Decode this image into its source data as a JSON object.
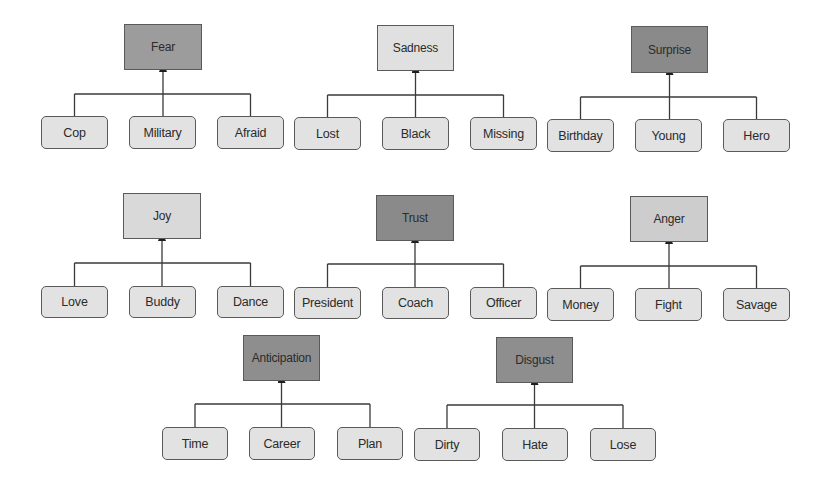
{
  "diagram": {
    "title": "",
    "colors": {
      "dark": "#8e8e8e",
      "medium": "#c6c6c6",
      "light": "#dedede",
      "child": "#e2e2e2",
      "line": "#3a3a3a"
    },
    "groups": [
      {
        "parent": {
          "label": "Fear",
          "shade": "medium-dark",
          "fill": "#9c9c9c",
          "x": 124,
          "y": 24,
          "w": 78,
          "h": 46
        },
        "bar_y": 94,
        "children": [
          {
            "label": "Cop",
            "x": 41,
            "y": 116,
            "w": 67,
            "h": 33
          },
          {
            "label": "Military",
            "x": 129,
            "y": 116,
            "w": 67,
            "h": 33
          },
          {
            "label": "Afraid",
            "x": 217,
            "y": 116,
            "w": 67,
            "h": 33
          }
        ]
      },
      {
        "parent": {
          "label": "Sadness",
          "shade": "light",
          "fill": "#e0e0e0",
          "x": 377,
          "y": 25,
          "w": 77,
          "h": 46
        },
        "bar_y": 95,
        "children": [
          {
            "label": "Lost",
            "x": 294,
            "y": 117,
            "w": 67,
            "h": 33
          },
          {
            "label": "Black",
            "x": 382,
            "y": 117,
            "w": 67,
            "h": 33
          },
          {
            "label": "Missing",
            "x": 470,
            "y": 117,
            "w": 67,
            "h": 33
          }
        ]
      },
      {
        "parent": {
          "label": "Surprise",
          "shade": "dark",
          "fill": "#8a8a8a",
          "x": 631,
          "y": 26,
          "w": 77,
          "h": 47
        },
        "bar_y": 97,
        "children": [
          {
            "label": "Birthday",
            "x": 547,
            "y": 119,
            "w": 67,
            "h": 33
          },
          {
            "label": "Young",
            "x": 635,
            "y": 119,
            "w": 67,
            "h": 33
          },
          {
            "label": "Hero",
            "x": 723,
            "y": 119,
            "w": 67,
            "h": 33
          }
        ]
      },
      {
        "parent": {
          "label": "Joy",
          "shade": "light",
          "fill": "#d9d9d9",
          "x": 123,
          "y": 193,
          "w": 78,
          "h": 46
        },
        "bar_y": 263,
        "children": [
          {
            "label": "Love",
            "x": 41,
            "y": 286,
            "w": 67,
            "h": 32
          },
          {
            "label": "Buddy",
            "x": 129,
            "y": 286,
            "w": 67,
            "h": 32
          },
          {
            "label": "Dance",
            "x": 217,
            "y": 286,
            "w": 67,
            "h": 32
          }
        ]
      },
      {
        "parent": {
          "label": "Trust",
          "shade": "dark",
          "fill": "#8a8a8a",
          "x": 376,
          "y": 195,
          "w": 78,
          "h": 46
        },
        "bar_y": 264,
        "children": [
          {
            "label": "President",
            "x": 294,
            "y": 287,
            "w": 67,
            "h": 32
          },
          {
            "label": "Coach",
            "x": 382,
            "y": 287,
            "w": 67,
            "h": 32
          },
          {
            "label": "Officer",
            "x": 470,
            "y": 287,
            "w": 67,
            "h": 32
          }
        ]
      },
      {
        "parent": {
          "label": "Anger",
          "shade": "medium",
          "fill": "#cdcdcd",
          "x": 630,
          "y": 196,
          "w": 78,
          "h": 46
        },
        "bar_y": 266,
        "children": [
          {
            "label": "Money",
            "x": 547,
            "y": 288,
            "w": 67,
            "h": 33
          },
          {
            "label": "Fight",
            "x": 635,
            "y": 288,
            "w": 67,
            "h": 33
          },
          {
            "label": "Savage",
            "x": 723,
            "y": 288,
            "w": 67,
            "h": 33
          }
        ]
      },
      {
        "parent": {
          "label": "Anticipation",
          "shade": "dark",
          "fill": "#8e8e8e",
          "x": 243,
          "y": 335,
          "w": 77,
          "h": 46
        },
        "bar_y": 404,
        "children": [
          {
            "label": "Time",
            "x": 162,
            "y": 427,
            "w": 66,
            "h": 33
          },
          {
            "label": "Career",
            "x": 249,
            "y": 427,
            "w": 66,
            "h": 33
          },
          {
            "label": "Plan",
            "x": 337,
            "y": 427,
            "w": 66,
            "h": 33
          }
        ]
      },
      {
        "parent": {
          "label": "Disgust",
          "shade": "dark",
          "fill": "#8e8e8e",
          "x": 496,
          "y": 337,
          "w": 77,
          "h": 46
        },
        "bar_y": 405,
        "children": [
          {
            "label": "Dirty",
            "x": 414,
            "y": 428,
            "w": 66,
            "h": 33
          },
          {
            "label": "Hate",
            "x": 502,
            "y": 428,
            "w": 66,
            "h": 33
          },
          {
            "label": "Lose",
            "x": 590,
            "y": 428,
            "w": 66,
            "h": 33
          }
        ]
      }
    ]
  }
}
